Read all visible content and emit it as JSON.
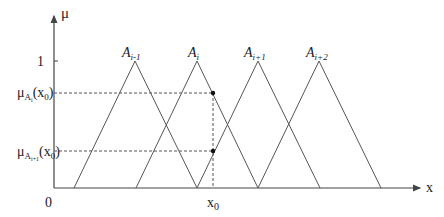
{
  "axes": {
    "y_label": "μ",
    "x_label": "x",
    "origin_label": "0",
    "y_tick_one": "1",
    "x0_label": "x",
    "x0_sub": "0"
  },
  "levels": {
    "upper": {
      "mu": "μ",
      "sub_A": "A",
      "sub_i": "i",
      "arg": "(x",
      "arg_sub": "0",
      "close": ")"
    },
    "lower": {
      "mu": "μ",
      "sub_A": "A",
      "sub_i": "i+1",
      "arg": "(x",
      "arg_sub": "0",
      "close": ")"
    }
  },
  "sets": [
    {
      "base": "A",
      "sub": "i-1"
    },
    {
      "base": "A",
      "sub": "i"
    },
    {
      "base": "A",
      "sub": "i+1"
    },
    {
      "base": "A",
      "sub": "i+2"
    }
  ],
  "colors": {
    "line": "#555555",
    "axis": "#444444",
    "text": "#222222"
  }
}
